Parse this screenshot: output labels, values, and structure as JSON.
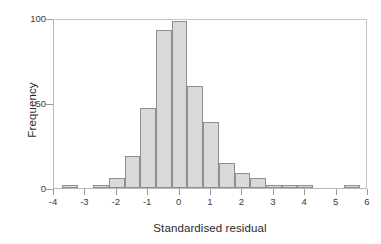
{
  "chart_data": {
    "type": "bar",
    "title": "",
    "subtitle": "",
    "xlabel": "Standardised residual",
    "ylabel": "Frequency",
    "xlim": [
      -4,
      6
    ],
    "ylim": [
      0,
      100
    ],
    "grid": false,
    "legend": null,
    "bin_width": 0.5,
    "bin_edges": [
      -3.75,
      -3.25,
      -2.75,
      -2.25,
      -1.75,
      -1.25,
      -0.75,
      -0.25,
      0.25,
      0.75,
      1.25,
      1.75,
      2.25,
      2.75,
      3.25,
      3.75,
      4.25,
      4.75,
      5.25,
      5.75
    ],
    "bin_centers": [
      -3.5,
      -3.0,
      -2.5,
      -2.0,
      -1.5,
      -1.0,
      -0.5,
      0.0,
      0.5,
      1.0,
      1.5,
      2.0,
      2.5,
      3.0,
      3.5,
      4.0,
      4.5,
      5.0,
      5.5
    ],
    "values": [
      1,
      0,
      2,
      6,
      19,
      47,
      93,
      98,
      60,
      39,
      15,
      9,
      6,
      2,
      1,
      1,
      0,
      0,
      1
    ],
    "xticks": [
      -4,
      -3,
      -2,
      -1,
      0,
      1,
      2,
      3,
      4,
      5,
      6
    ],
    "xticklabels": [
      "-4",
      "-3",
      "-2",
      "-1",
      "0",
      "1",
      "2",
      "3",
      "4",
      "5",
      "6"
    ],
    "yticks": [
      0,
      50,
      100
    ],
    "yticklabels": [
      "0",
      "50",
      "100"
    ],
    "bar_fill_color": "#d9d9d9",
    "bar_edge_color": "#8f8f8f",
    "axis_color": "#9a9a9a",
    "background_color": "#ffffff"
  }
}
